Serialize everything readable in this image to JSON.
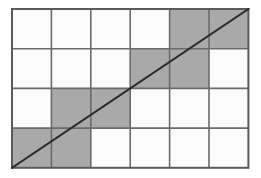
{
  "figure": {
    "type": "grid-diagram",
    "background_color": "#ffffff"
  },
  "grid": {
    "columns": 6,
    "rows": 4,
    "outer_border_color": "#5a5a5a",
    "outer_border_width": 2,
    "grid_line_color": "#6b6b6b",
    "grid_line_width": 1.6,
    "cell_fill_empty": "#fbfbfb",
    "cell_fill_shaded": "#a9a9a9",
    "origin_x": 1,
    "origin_y": 1,
    "cell_width": 39.4,
    "cell_height": 39.7,
    "row_labels": [
      "row-1",
      "row-2",
      "row-3",
      "row-4"
    ],
    "column_labels": [
      "col-1",
      "col-2",
      "col-3",
      "col-4",
      "col-5",
      "col-6"
    ],
    "shaded_cells": [
      {
        "row": 1,
        "col": 5
      },
      {
        "row": 1,
        "col": 6
      },
      {
        "row": 2,
        "col": 4
      },
      {
        "row": 2,
        "col": 5
      },
      {
        "row": 3,
        "col": 2
      },
      {
        "row": 3,
        "col": 3
      },
      {
        "row": 4,
        "col": 1
      },
      {
        "row": 4,
        "col": 2
      }
    ],
    "cell_matrix": [
      [
        "empty",
        "empty",
        "empty",
        "empty",
        "shaded",
        "shaded"
      ],
      [
        "empty",
        "empty",
        "empty",
        "shaded",
        "shaded",
        "empty"
      ],
      [
        "empty",
        "shaded",
        "shaded",
        "empty",
        "empty",
        "empty"
      ],
      [
        "shaded",
        "shaded",
        "empty",
        "empty",
        "empty",
        "empty"
      ]
    ]
  },
  "diagonal": {
    "label": "diagonal-line",
    "color": "#2b2b2b",
    "width": 2,
    "start": {
      "x": 0,
      "y": 4
    },
    "end": {
      "x": 6,
      "y": 0
    },
    "description": "straight line from bottom-left corner to top-right corner"
  }
}
